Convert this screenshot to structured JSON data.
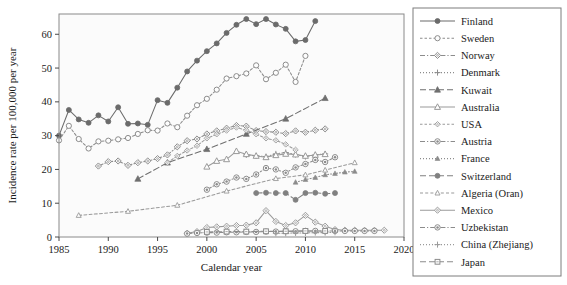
{
  "chart_data": {
    "type": "line",
    "title": "",
    "xlabel": "Calendar year",
    "ylabel": "Incidence rate per 100,000 per year",
    "xlim": [
      1985,
      2020
    ],
    "ylim": [
      0,
      66
    ],
    "xticks": [
      1985,
      1990,
      1995,
      2000,
      2005,
      2010,
      2015,
      2020
    ],
    "yticks": [
      0,
      10,
      20,
      30,
      40,
      50,
      60
    ],
    "grid": false,
    "legend_position": "right-outside",
    "series": [
      {
        "name": "Finland",
        "marker": "filled-circle",
        "linestyle": "solid",
        "color": "#6b6b6b",
        "x": [
          1985,
          1986,
          1987,
          1988,
          1989,
          1990,
          1991,
          1992,
          1993,
          1994,
          1995,
          1996,
          1997,
          1998,
          1999,
          2000,
          2001,
          2002,
          2003,
          2004,
          2005,
          2006,
          2007,
          2008,
          2009,
          2010,
          2011
        ],
        "y": [
          30.0,
          37.6,
          34.8,
          33.8,
          36.0,
          34.2,
          38.4,
          33.5,
          33.6,
          33.2,
          40.5,
          39.7,
          44.2,
          49.0,
          52.2,
          55.0,
          57.3,
          60.4,
          62.8,
          64.5,
          63.0,
          64.5,
          62.9,
          61.6,
          57.9,
          58.3,
          63.9
        ]
      },
      {
        "name": "Sweden",
        "marker": "open-circle",
        "linestyle": "dashed-dot",
        "color": "#8c8c8c",
        "x": [
          1985,
          1986,
          1987,
          1988,
          1989,
          1990,
          1991,
          1992,
          1993,
          1994,
          1995,
          1996,
          1997,
          1998,
          1999,
          2000,
          2001,
          2002,
          2003,
          2004,
          2005,
          2006,
          2007,
          2008,
          2009,
          2010
        ],
        "y": [
          28.6,
          32.9,
          29.0,
          26.2,
          28.3,
          28.5,
          28.9,
          29.3,
          30.5,
          31.6,
          31.5,
          33.6,
          32.5,
          35.9,
          39.0,
          40.9,
          43.6,
          46.9,
          47.6,
          48.4,
          50.8,
          46.7,
          48.6,
          51.0,
          45.9,
          53.6
        ]
      },
      {
        "name": "Norway",
        "marker": "open-diamond",
        "linestyle": "dash-dot",
        "color": "#8c8c8c",
        "x": [
          1989,
          1990,
          1991,
          1992,
          1993,
          1994,
          1995,
          1996,
          1997,
          1998,
          1999,
          2000,
          2001,
          2002,
          2003,
          2004,
          2005,
          2006,
          2007,
          2008,
          2009,
          2010,
          2011,
          2012
        ],
        "y": [
          21.0,
          22.3,
          22.5,
          21.2,
          22.0,
          22.5,
          23.2,
          24.3,
          26.7,
          28.5,
          29.0,
          30.5,
          31.4,
          32.2,
          33.0,
          32.8,
          31.5,
          31.2,
          31.0,
          30.6,
          31.4,
          31.0,
          31.6,
          32.0
        ]
      },
      {
        "name": "Denmark",
        "marker": "plus",
        "linestyle": "dotted",
        "color": "#8c8c8c",
        "x": [
          2004,
          2005,
          2006,
          2007,
          2008,
          2009,
          2010,
          2011,
          2012
        ],
        "y": [
          24.3,
          24.0,
          23.8,
          24.6,
          25.0,
          24.4,
          23.8,
          24.3,
          24.6
        ]
      },
      {
        "name": "Kuwait",
        "marker": "filled-triangle",
        "linestyle": "long-dashed",
        "color": "#6f6f6f",
        "x": [
          1993,
          1996,
          2000,
          2004,
          2008,
          2012
        ],
        "y": [
          17.2,
          22.0,
          26.0,
          30.5,
          35.0,
          41.1
        ]
      },
      {
        "name": "Australia",
        "marker": "open-triangle-up",
        "linestyle": "solid",
        "color": "#9a9a9a",
        "x": [
          2000,
          2001,
          2002,
          2003,
          2004,
          2005,
          2006,
          2007,
          2008,
          2009,
          2010,
          2011,
          2012
        ],
        "y": [
          20.8,
          22.5,
          23.0,
          25.4,
          24.5,
          24.0,
          23.6,
          24.2,
          24.6,
          24.4,
          24.0,
          24.3,
          24.5
        ]
      },
      {
        "name": "USA",
        "marker": "open-diamond-small",
        "linestyle": "dashed-dot",
        "color": "#9a9a9a",
        "x": [
          1996,
          1997,
          1998,
          1999,
          2000,
          2001,
          2002,
          2003,
          2004,
          2005,
          2006,
          2007,
          2008,
          2009
        ],
        "y": [
          22.0,
          24.0,
          25.6,
          27.0,
          29.2,
          30.4,
          31.5,
          32.4,
          31.6,
          30.4,
          29.2,
          28.6,
          27.4,
          25.8
        ]
      },
      {
        "name": "Austria",
        "marker": "filled-circle-ring",
        "linestyle": "dash-dot",
        "color": "#8c8c8c",
        "x": [
          2000,
          2001,
          2002,
          2003,
          2004,
          2005,
          2006,
          2007,
          2008,
          2009,
          2010,
          2011,
          2012,
          2013
        ],
        "y": [
          14.0,
          15.6,
          16.4,
          17.6,
          17.2,
          18.5,
          20.4,
          20.0,
          19.0,
          20.6,
          21.6,
          22.8,
          22.2,
          23.6
        ]
      },
      {
        "name": "France",
        "marker": "filled-triangle-small",
        "linestyle": "dotted",
        "color": "#8c8c8c",
        "x": [
          2009,
          2010,
          2011,
          2012,
          2013,
          2014,
          2015
        ],
        "y": [
          16.2,
          17.0,
          17.6,
          18.4,
          18.8,
          19.2,
          19.4
        ]
      },
      {
        "name": "Switzerland",
        "marker": "filled-circle",
        "linestyle": "long-dashed",
        "color": "#808080",
        "x": [
          2005,
          2006,
          2007,
          2008,
          2009,
          2010,
          2011,
          2012,
          2013
        ],
        "y": [
          13.0,
          13.1,
          13.0,
          13.0,
          11.0,
          13.0,
          13.1,
          12.8,
          13.0
        ]
      },
      {
        "name": "Algeria (Oran)",
        "marker": "open-triangle-up-small",
        "linestyle": "dashed",
        "color": "#9a9a9a",
        "x": [
          1987,
          1992,
          1997,
          2002,
          2007,
          2010,
          2012,
          2015
        ],
        "y": [
          6.4,
          7.6,
          9.4,
          13.6,
          17.3,
          18.4,
          19.8,
          22.0
        ]
      },
      {
        "name": "Mexico",
        "marker": "open-diamond",
        "linestyle": "solid",
        "color": "#9a9a9a",
        "x": [
          1998,
          1999,
          2000,
          2001,
          2002,
          2003,
          2004,
          2005,
          2006,
          2007,
          2008,
          2009,
          2010,
          2011,
          2012,
          2013,
          2014,
          2015,
          2016,
          2017,
          2018
        ],
        "y": [
          1.1,
          1.6,
          2.8,
          3.0,
          3.2,
          3.4,
          3.5,
          4.2,
          7.8,
          4.6,
          3.4,
          4.2,
          6.4,
          4.4,
          3.2,
          2.2,
          2.0,
          2.0,
          2.0,
          2.0,
          2.0
        ]
      },
      {
        "name": "Uzbekistan",
        "marker": "filled-circle-ring",
        "linestyle": "dash-dot",
        "color": "#8c8c8c",
        "x": [
          1998,
          1999,
          2000,
          2001,
          2002,
          2003,
          2004,
          2005,
          2006,
          2007,
          2008,
          2009,
          2010,
          2011,
          2012,
          2013,
          2014,
          2015,
          2016,
          2017
        ],
        "y": [
          1.0,
          1.2,
          1.3,
          1.3,
          1.4,
          1.4,
          1.5,
          1.5,
          1.6,
          1.6,
          1.7,
          1.7,
          1.8,
          1.8,
          1.7,
          1.8,
          1.8,
          1.8,
          1.8,
          1.8
        ]
      },
      {
        "name": "China (Zhejiang)",
        "marker": "plus",
        "linestyle": "dotted",
        "color": "#9a9a9a",
        "x": [
          2007,
          2008,
          2009,
          2010,
          2011,
          2012,
          2013
        ],
        "y": [
          1.1,
          1.1,
          1.2,
          1.2,
          1.3,
          1.3,
          1.4
        ]
      },
      {
        "name": "Japan",
        "marker": "open-square-small",
        "linestyle": "long-dashed",
        "color": "#8c8c8c",
        "x": [
          2000,
          2002,
          2004,
          2006,
          2008,
          2010,
          2012
        ],
        "y": [
          1.5,
          1.6,
          1.6,
          1.7,
          1.7,
          1.8,
          1.8
        ]
      }
    ]
  }
}
